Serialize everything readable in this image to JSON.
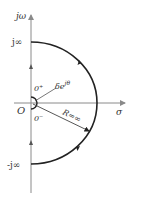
{
  "diagram": {
    "type": "nyquist-contour",
    "labels": {
      "y_axis": "jω",
      "x_axis": "σ",
      "origin": "O",
      "top": "j∞",
      "bottom": "-j∞",
      "zero_plus": "0⁺",
      "zero_minus": "0⁻",
      "small_arc": "δe",
      "small_arc_exp": "jθ",
      "radius": "R=∞"
    },
    "colors": {
      "axis": "#8a8a8a",
      "contour": "#222222",
      "text": "#333333"
    }
  }
}
